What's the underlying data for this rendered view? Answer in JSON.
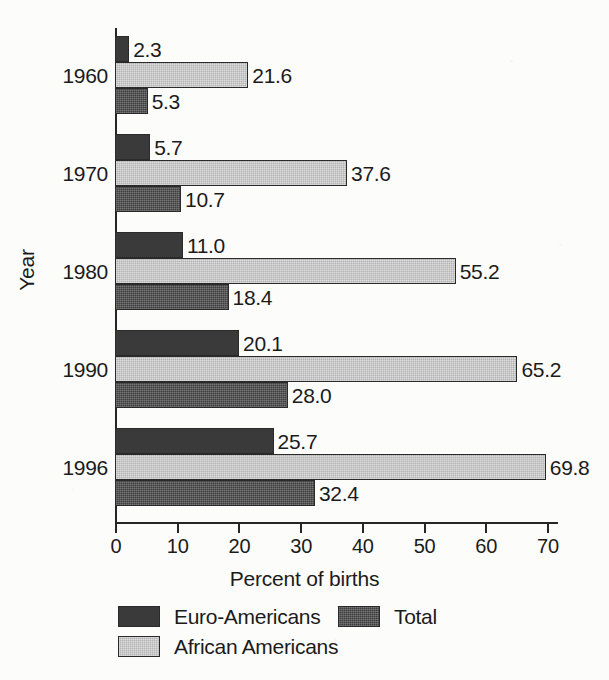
{
  "figure": {
    "background_color": "#fcfcfa",
    "ink_color": "#1b1b1b"
  },
  "chart_data": {
    "type": "bar",
    "orientation": "horizontal",
    "title": "",
    "subtitle": "",
    "xlabel": "Percent of births",
    "ylabel": "Year",
    "categories": [
      "1960",
      "1970",
      "1980",
      "1990",
      "1996"
    ],
    "series": [
      {
        "name": "Euro-Americans",
        "color": "#3a3a3a",
        "fill": "solid-dark",
        "values": [
          2.3,
          5.7,
          11.0,
          20.1,
          25.7
        ],
        "labels": [
          "2.3",
          "5.7",
          "11.0",
          "20.1",
          "25.7"
        ]
      },
      {
        "name": "African Americans",
        "color": "#b4b4b4",
        "fill": "light-dither",
        "values": [
          21.6,
          37.6,
          55.2,
          65.2,
          69.8
        ],
        "labels": [
          "21.6",
          "37.6",
          "55.2",
          "65.2",
          "69.8"
        ]
      },
      {
        "name": "Total",
        "color": "#3f3f3f",
        "fill": "dark-dither",
        "values": [
          5.3,
          10.7,
          18.4,
          28.0,
          32.4
        ],
        "labels": [
          "5.3",
          "10.7",
          "18.4",
          "28.0",
          "32.4"
        ]
      }
    ],
    "xticks": [
      0,
      10,
      20,
      30,
      40,
      50,
      60,
      70
    ],
    "xtick_labels": [
      "0",
      "10",
      "20",
      "30",
      "40",
      "50",
      "60",
      "70"
    ],
    "xlim": [
      0,
      70
    ],
    "grid": false,
    "value_labels_shown": true,
    "legend": {
      "position": "bottom",
      "entries": [
        {
          "label": "Euro-Americans",
          "series": 0
        },
        {
          "label": "Total",
          "series": 2
        },
        {
          "label": "African Americans",
          "series": 1
        }
      ]
    }
  },
  "axis": {
    "y_title": "Year",
    "x_title": "Percent of births"
  }
}
